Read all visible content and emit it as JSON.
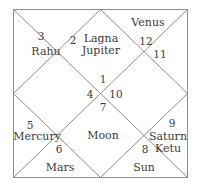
{
  "chart": {
    "style": "north-indian-kundali",
    "line_color": "#8a8a8a",
    "text_color": "#3d3a38",
    "background": "#ffffff",
    "houses": [
      {
        "number": "1",
        "planets": [
          "Lagna",
          "Jupiter"
        ]
      },
      {
        "number": "2",
        "planets": []
      },
      {
        "number": "3",
        "planets": [
          "Rahu"
        ]
      },
      {
        "number": "4",
        "planets": [
          "Moon"
        ]
      },
      {
        "number": "5",
        "planets": [
          "Mercury"
        ]
      },
      {
        "number": "6",
        "planets": [
          "Mars"
        ]
      },
      {
        "number": "7",
        "planets": []
      },
      {
        "number": "8",
        "planets": [
          "Sun"
        ]
      },
      {
        "number": "9",
        "planets": [
          "Saturn",
          "Ketu"
        ]
      },
      {
        "number": "10",
        "planets": []
      },
      {
        "number": "11",
        "planets": []
      },
      {
        "number": "12",
        "planets": [
          "Venus"
        ]
      }
    ],
    "labels": {
      "num_1": "1",
      "num_2": "2",
      "num_3": "3",
      "num_4": "4",
      "num_5": "5",
      "num_6": "6",
      "num_7": "7",
      "num_8": "8",
      "num_9": "9",
      "num_10": "10",
      "num_11": "11",
      "num_12": "12",
      "lagna": "Lagna",
      "jupiter": "Jupiter",
      "venus": "Venus",
      "rahu": "Rahu",
      "moon": "Moon",
      "mercury": "Mercury",
      "mars": "Mars",
      "sun": "Sun",
      "saturn": "Saturn",
      "ketu": "Ketu"
    }
  }
}
